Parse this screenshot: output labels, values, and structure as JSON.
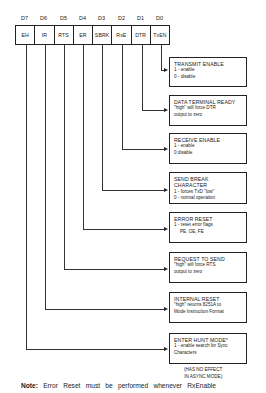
{
  "register": {
    "bits": [
      {
        "pos": "D7",
        "name": "EH"
      },
      {
        "pos": "D6",
        "name": "IR"
      },
      {
        "pos": "D5",
        "name": "RTS"
      },
      {
        "pos": "D4",
        "name": "ER"
      },
      {
        "pos": "D3",
        "name": "SBRK"
      },
      {
        "pos": "D2",
        "name": "RxE"
      },
      {
        "pos": "D1",
        "name": "DTR"
      },
      {
        "pos": "D0",
        "name": "TxEN"
      }
    ]
  },
  "boxes": [
    {
      "title": "TRANSMIT ENABLE",
      "lines": [
        "1 - enable",
        "0 - disable"
      ]
    },
    {
      "title": "DATA TERMINAL READY",
      "lines": [
        "\"high\" will force DTR",
        "output to zero"
      ]
    },
    {
      "title": "RECEIVE ENABLE",
      "lines": [
        "1 - enable",
        "0   disable"
      ]
    },
    {
      "title": "SEND BREAK CHARACTER",
      "lines": [
        "1 - forces TxD \"low\"",
        "0 - normal operation"
      ]
    },
    {
      "title": "ERROR RESET",
      "lines": [
        "1 - reset error flags",
        "PE, OE, FE"
      ]
    },
    {
      "title": "REQUEST TO SEND",
      "lines": [
        "\"high\" will force RTS",
        "output to zero"
      ]
    },
    {
      "title": "INTERNAL RESET",
      "lines": [
        "\"high\" returns 8251A to",
        "Mode Instruction Format"
      ]
    },
    {
      "title": "ENTER HUNT MODE*",
      "lines": [
        "1 - enable search for Sync",
        "Characters"
      ]
    }
  ],
  "footnote": [
    "(HAS NO EFFECT",
    "IN ASYNC MODE)"
  ],
  "note": {
    "label": "Note:",
    "text": "Error Reset must be performed whenever RxEnable"
  }
}
